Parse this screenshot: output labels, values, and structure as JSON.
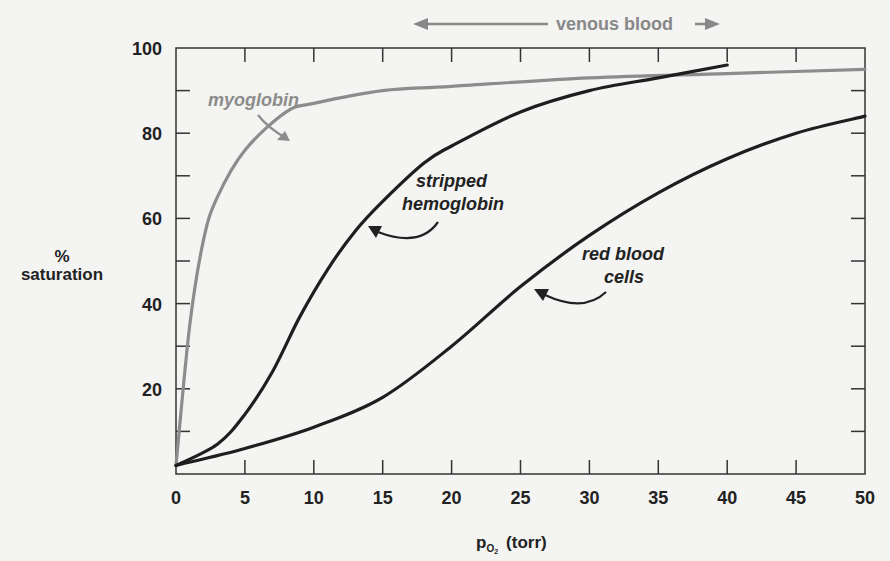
{
  "chart_data": {
    "type": "line",
    "title": "",
    "xlabel": "pO2 (torr)",
    "ylabel": "% saturation",
    "xlim": [
      0,
      50
    ],
    "ylim": [
      0,
      100
    ],
    "x_ticks": [
      0,
      5,
      10,
      15,
      20,
      25,
      30,
      35,
      40,
      45,
      50
    ],
    "y_ticks": [
      20,
      40,
      60,
      80,
      100
    ],
    "grid": false,
    "legend": "none (curves labeled directly)",
    "series": [
      {
        "name": "myoglobin",
        "color": "#8c8c8c",
        "x": [
          0,
          1,
          2,
          3,
          5,
          8,
          10,
          15,
          20,
          30,
          40,
          50
        ],
        "y": [
          2,
          35,
          55,
          65,
          76,
          85,
          87,
          90,
          91,
          93,
          94,
          95
        ]
      },
      {
        "name": "stripped hemoglobin",
        "color": "#1e1e1e",
        "x": [
          0,
          3,
          5,
          7,
          9,
          11,
          13,
          15,
          18,
          20,
          25,
          30,
          35,
          40
        ],
        "y": [
          2,
          7,
          14,
          24,
          37,
          48,
          57,
          64,
          73,
          77,
          85,
          90,
          93,
          96
        ]
      },
      {
        "name": "red blood cells",
        "color": "#1e1e1e",
        "x": [
          0,
          5,
          10,
          15,
          20,
          25,
          30,
          35,
          40,
          45,
          50
        ],
        "y": [
          2,
          6,
          11,
          18,
          30,
          44,
          56,
          66,
          74,
          80,
          84
        ]
      }
    ],
    "annotations": [
      {
        "text": "venous blood",
        "note": "double-headed arrow spanning ~17 to ~40 torr above plot"
      },
      {
        "text": "myoglobin",
        "arrow_to": "myoglobin curve"
      },
      {
        "text": "stripped hemoglobin",
        "arrow_to": "stripped hemoglobin curve"
      },
      {
        "text": "red blood cells",
        "arrow_to": "red blood cells curve"
      }
    ]
  },
  "labels": {
    "venous": "venous blood",
    "ylabel_top": "%",
    "ylabel_bottom": "saturation",
    "xlabel_p": "p",
    "xlabel_sub": "O",
    "xlabel_sub2": "2",
    "xlabel_unit": "(torr)",
    "myoglobin": "myoglobin",
    "stripped_1": "stripped",
    "stripped_2": "hemoglobin",
    "rbc_1": "red blood",
    "rbc_2": "cells"
  },
  "colors": {
    "myoglobin": "#8c8c8c",
    "hemoglobin": "#1e1e1e",
    "axis": "#333333",
    "venous": "#888888"
  }
}
